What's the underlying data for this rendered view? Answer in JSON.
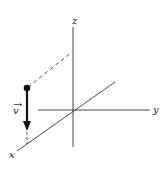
{
  "diagram": {
    "axes": {
      "x_label": "x",
      "y_label": "y",
      "z_label": "z"
    },
    "vector": {
      "label": "v",
      "has_arrow_accent": true,
      "direction": "down (negative z)"
    },
    "colors": {
      "axis": "#333333",
      "vector": "#111111",
      "dashed": "#444444"
    }
  }
}
